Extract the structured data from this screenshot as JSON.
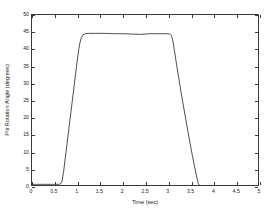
{
  "chart_data": {
    "type": "line",
    "title": "",
    "xlabel": "Time (sec)",
    "ylabel": "Phi Rotation Angle (degrees)",
    "xlim": [
      0,
      5
    ],
    "ylim": [
      0,
      50
    ],
    "xticks": [
      0,
      0.5,
      1,
      1.5,
      2,
      2.5,
      3,
      3.5,
      4,
      4.5,
      5
    ],
    "xtick_labels": [
      "0",
      "0.5",
      "1",
      "1.5",
      "2",
      "2.5",
      "3",
      "3.5",
      "4",
      "4.5",
      "5"
    ],
    "yticks": [
      0,
      5,
      10,
      15,
      20,
      25,
      30,
      35,
      40,
      45,
      50
    ],
    "ytick_labels": [
      "0",
      "5",
      "10",
      "15",
      "20",
      "25",
      "30",
      "35",
      "40",
      "45",
      "50"
    ],
    "grid": false,
    "legend": null,
    "box": true,
    "line_color": "#3a3a3a",
    "line_width": 0.8,
    "series": [
      {
        "name": "Phi Rotation Angle",
        "x": [
          0.0,
          0.1,
          0.2,
          0.3,
          0.4,
          0.5,
          0.58,
          0.63,
          0.66,
          0.7,
          0.76,
          0.82,
          0.88,
          0.94,
          1.0,
          1.03,
          1.06,
          1.09,
          1.13,
          1.18,
          1.25,
          1.4,
          1.6,
          1.8,
          2.0,
          2.2,
          2.4,
          2.5,
          2.6,
          2.8,
          3.0,
          3.05,
          3.08,
          3.11,
          3.14,
          3.18,
          3.24,
          3.32,
          3.4,
          3.48,
          3.55,
          3.6,
          3.65,
          3.68,
          3.72,
          3.78,
          3.85,
          4.0,
          4.2,
          4.4,
          4.6,
          4.8,
          5.0
        ],
        "y": [
          0.2,
          0.2,
          0.2,
          0.2,
          0.2,
          0.2,
          0.2,
          0.3,
          0.8,
          4.0,
          10.5,
          17.0,
          23.5,
          30.0,
          36.5,
          39.5,
          41.8,
          43.3,
          44.2,
          44.5,
          44.6,
          44.6,
          44.6,
          44.5,
          44.5,
          44.4,
          44.3,
          44.4,
          44.5,
          44.5,
          44.5,
          44.4,
          44.0,
          42.8,
          40.5,
          37.0,
          32.0,
          25.5,
          19.5,
          13.5,
          8.5,
          5.2,
          2.0,
          0.4,
          -0.4,
          -0.6,
          -0.6,
          -0.6,
          -0.6,
          -0.6,
          -0.6,
          -0.6,
          -0.6
        ],
        "description": "Trapezoidal rotation profile: flat near 0 deg until ~0.65 s, steep ramp to plateau ~44.6 deg by ~1.15 s, held until ~3.1 s, then slower ramp down to about -0.6 deg by ~3.7 s and flat thereafter."
      }
    ]
  }
}
